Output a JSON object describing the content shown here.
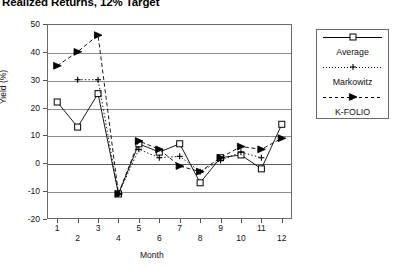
{
  "title": "Realized Returns, 12% Target",
  "axes": {
    "ylabel": "Yield (%)",
    "xlabel": "Month",
    "yticks": [
      "50",
      "40",
      "30",
      "20",
      "10",
      "0",
      "-10",
      "-20"
    ],
    "xticks": [
      "1",
      "2",
      "3",
      "4",
      "5",
      "6",
      "7",
      "8",
      "9",
      "10",
      "11",
      "12"
    ]
  },
  "legend": {
    "items": [
      {
        "label": "Average",
        "marker": "square-marker",
        "line": "solid"
      },
      {
        "label": "Markowitz",
        "marker": "plus-marker",
        "line": "dotted"
      },
      {
        "label": "K-FOLIO",
        "marker": "triangle-marker",
        "line": "dashed"
      }
    ]
  },
  "chart_data": {
    "type": "line",
    "title": "Realized Returns, 12% Target",
    "xlabel": "Month",
    "ylabel": "Yield (%)",
    "categories": [
      1,
      2,
      3,
      4,
      5,
      6,
      7,
      8,
      9,
      10,
      11,
      12
    ],
    "xlim": [
      0.5,
      12.5
    ],
    "ylim": [
      -20,
      50
    ],
    "ytick_step": 10,
    "grid": true,
    "legend_position": "right-outside",
    "series": [
      {
        "name": "Average",
        "marker": "square",
        "linestyle": "solid",
        "values": [
          22,
          13,
          25,
          -11,
          7,
          4,
          7,
          -7,
          2,
          3,
          -2,
          14
        ]
      },
      {
        "name": "Markowitz",
        "marker": "plus",
        "linestyle": "dotted",
        "values": [
          null,
          30,
          30,
          -11,
          5,
          2,
          2.5,
          -3,
          1,
          4,
          2,
          null
        ]
      },
      {
        "name": "K-FOLIO",
        "marker": "triangle",
        "linestyle": "dashed",
        "values": [
          35,
          40,
          46,
          -11,
          8,
          5,
          -1,
          -3,
          2,
          6,
          5,
          9
        ]
      }
    ]
  }
}
